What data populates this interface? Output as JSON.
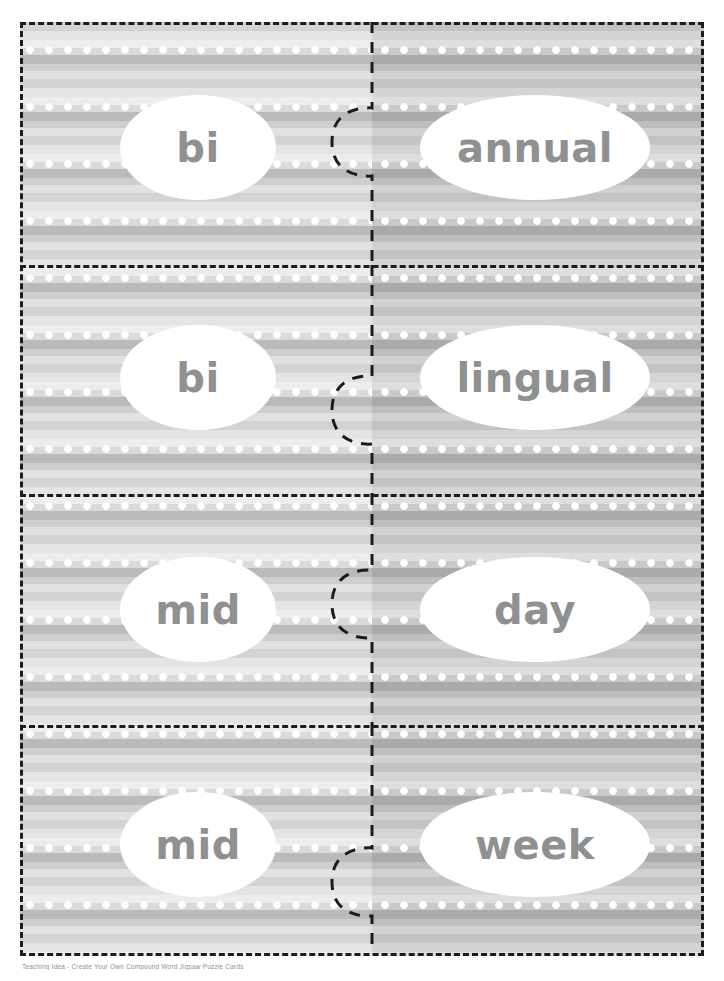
{
  "document": {
    "title": "Compound Word Puzzle Cards",
    "footer_text": "Teaching Idea  -  Create Your Own Compound Word Jigsaw Puzzle Cards"
  },
  "theme": {
    "ink_color": "#1c1c1c",
    "word_color": "#8e9190",
    "bubble_fill": "#ffffff",
    "left_panel_base": "#d9dad9",
    "right_panel_base": "#c8cac9",
    "dot_color": "#ffffff"
  },
  "pattern": {
    "style": "horizontal-stripes-with-polka-dots",
    "stripe_period_px": 57,
    "dot_spacing_px": 19,
    "dot_radius_px": 3.4
  },
  "puzzle": {
    "columns": 2,
    "rows": 4,
    "cut_style": "dashed",
    "interlock": "jigsaw-tab",
    "pairs": [
      {
        "left": "bi",
        "right": "annual",
        "compound": "biannual",
        "tab_center_y": 120
      },
      {
        "left": "bi",
        "right": "lingual",
        "compound": "bilingual",
        "tab_center_y": 388
      },
      {
        "left": "mid",
        "right": "day",
        "compound": "midday",
        "tab_center_y": 582
      },
      {
        "left": "mid",
        "right": "week",
        "compound": "midweek",
        "tab_center_y": 860
      }
    ]
  }
}
